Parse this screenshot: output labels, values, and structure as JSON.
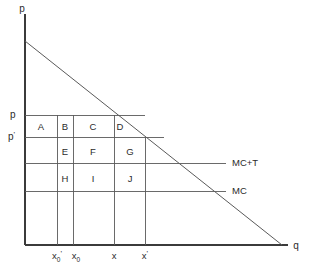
{
  "figure": {
    "kind": "economics-diagram",
    "background_color": "#ffffff",
    "line_color": "#5a5a5a",
    "axis_color": "#3b3b3b",
    "text_color": "#2b2b2b"
  },
  "axes": {
    "y_axis_label": "p",
    "x_axis_label": "q",
    "y_axis_label_name": "price",
    "x_axis_label_name": "quantity"
  },
  "price_ticks": [
    {
      "id": "p",
      "label": "p",
      "prime": "",
      "y": 115
    },
    {
      "id": "p1",
      "label": "p",
      "prime": "'",
      "y": 137
    }
  ],
  "quantity_ticks": [
    {
      "id": "x0prime",
      "base": "x",
      "sub": "0",
      "prime": "'",
      "x": 57
    },
    {
      "id": "x0",
      "base": "x",
      "sub": "0",
      "prime": "",
      "x": 73
    },
    {
      "id": "x",
      "base": "x",
      "sub": "",
      "prime": "",
      "x": 114
    },
    {
      "id": "xprime",
      "base": "x",
      "sub": "",
      "prime": "'",
      "x": 145
    }
  ],
  "cost_curves": [
    {
      "id": "mc_plus_t",
      "label": "MC+T",
      "y": 163,
      "x_start": 25,
      "x_end": 226,
      "label_x": 232
    },
    {
      "id": "mc",
      "label": "MC",
      "y": 191,
      "x_start": 25,
      "x_end": 226,
      "label_x": 232
    }
  ],
  "demand_curve": {
    "label": "demand",
    "x1": 25,
    "y1": 41,
    "x2": 282,
    "y2": 245
  },
  "cells": [
    {
      "id": "A",
      "label": "A",
      "cx": 41,
      "cy": 127
    },
    {
      "id": "B",
      "label": "B",
      "cx": 65,
      "cy": 127
    },
    {
      "id": "C",
      "label": "C",
      "cx": 93,
      "cy": 127
    },
    {
      "id": "D",
      "label": "D",
      "cx": 120,
      "cy": 127
    },
    {
      "id": "E",
      "label": "E",
      "cx": 65,
      "cy": 152
    },
    {
      "id": "F",
      "label": "F",
      "cx": 93,
      "cy": 152
    },
    {
      "id": "G",
      "label": "G",
      "cx": 130,
      "cy": 152
    },
    {
      "id": "H",
      "label": "H",
      "cx": 65,
      "cy": 179
    },
    {
      "id": "I",
      "label": "I",
      "cx": 93,
      "cy": 179
    },
    {
      "id": "J",
      "label": "J",
      "cx": 130,
      "cy": 179
    }
  ],
  "geometry": {
    "origin_x": 25,
    "origin_y": 245,
    "y_axis_top": 14,
    "x_axis_right": 288,
    "row_lines_y": [
      115,
      137,
      163,
      191
    ],
    "col_lines_x": [
      57,
      73,
      114,
      145
    ]
  }
}
